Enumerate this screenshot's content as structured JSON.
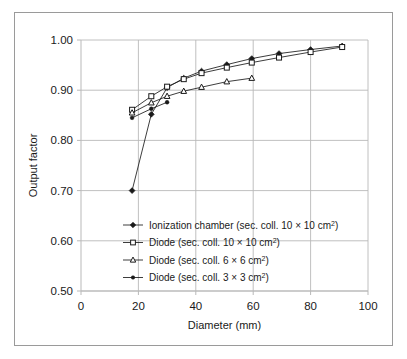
{
  "figure": {
    "border_color": "#9a9a9a",
    "background": "#ffffff",
    "grid_color": "#b9b9b9",
    "series_color": "#1a1a1a"
  },
  "axis": {
    "x_label": "Diameter (mm)",
    "y_label": "Output factor",
    "x_ticks": [
      "0",
      "20",
      "40",
      "60",
      "80",
      "100"
    ],
    "y_ticks": [
      "0.50",
      "0.60",
      "0.70",
      "0.80",
      "0.90",
      "1.00"
    ]
  },
  "legend": {
    "items": [
      {
        "label_pre": "Ionization chamber (sec. coll. 10 ",
        "times": "×",
        "label_mid": " 10 cm",
        "sup": "2",
        "label_post": ")",
        "marker": "diamond"
      },
      {
        "label_pre": "Diode (sec. coll. 10 ",
        "times": "×",
        "label_mid": " 10 cm",
        "sup": "2",
        "label_post": ")",
        "marker": "square"
      },
      {
        "label_pre": "Diode (sec. coll. 6 ",
        "times": "×",
        "label_mid": " 6 cm",
        "sup": "2",
        "label_post": ")",
        "marker": "triangle"
      },
      {
        "label_pre": "Diode (sec. coll. 3 ",
        "times": "×",
        "label_mid": " 3 cm",
        "sup": "2",
        "label_post": ")",
        "marker": "dot"
      }
    ]
  },
  "chart_data": {
    "type": "line",
    "title": "",
    "xlabel": "Diameter (mm)",
    "ylabel": "Output factor",
    "xlim": [
      0,
      100
    ],
    "ylim": [
      0.5,
      1.0
    ],
    "xticks": [
      0,
      20,
      40,
      60,
      80,
      100
    ],
    "yticks": [
      0.5,
      0.6,
      0.7,
      0.8,
      0.9,
      1.0
    ],
    "grid": true,
    "legend_position": "inside-lower-left",
    "series": [
      {
        "name": "Ionization chamber (sec. coll. 10 × 10 cm2)",
        "marker": "diamond",
        "x": [
          17.8,
          24.5,
          30.0,
          35.8,
          42.0,
          50.8,
          59.5,
          69.0,
          80.0,
          91.0
        ],
        "y": [
          0.7,
          0.852,
          0.905,
          0.924,
          0.938,
          0.951,
          0.963,
          0.973,
          0.981,
          0.988
        ]
      },
      {
        "name": "Diode (sec. coll. 10 × 10 cm2)",
        "marker": "square",
        "x": [
          17.8,
          24.5,
          30.0,
          35.8,
          42.0,
          50.8,
          59.5,
          69.0,
          80.0,
          91.0
        ],
        "y": [
          0.861,
          0.888,
          0.907,
          0.922,
          0.934,
          0.945,
          0.955,
          0.965,
          0.976,
          0.986
        ]
      },
      {
        "name": "Diode (sec. coll. 6 × 6 cm2)",
        "marker": "triangle",
        "x": [
          17.8,
          24.5,
          30.0,
          35.8,
          42.0,
          50.8,
          59.5
        ],
        "y": [
          0.855,
          0.875,
          0.888,
          0.898,
          0.906,
          0.917,
          0.924
        ]
      },
      {
        "name": "Diode (sec. coll. 3 × 3 cm2)",
        "marker": "dot",
        "x": [
          17.8,
          24.5,
          30.0
        ],
        "y": [
          0.845,
          0.863,
          0.876
        ]
      }
    ]
  }
}
